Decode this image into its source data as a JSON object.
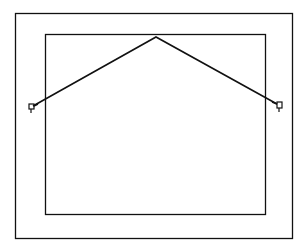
{
  "diagram": {
    "stroke_color": "#111111",
    "background_color": "#ffffff",
    "outer_frame": {
      "x": 15,
      "y": 13,
      "width": 277,
      "height": 225
    },
    "inner_panel": {
      "x": 45,
      "y": 34,
      "width": 220,
      "height": 180
    },
    "wire": {
      "left_end": {
        "x": 33,
        "y": 106
      },
      "apex": {
        "x": 156,
        "y": 37
      },
      "right_end": {
        "x": 277,
        "y": 104
      }
    },
    "hooks": [
      {
        "name": "left-eye-hook",
        "x": 31,
        "y": 108
      },
      {
        "name": "right-eye-hook",
        "x": 280,
        "y": 108
      }
    ]
  }
}
